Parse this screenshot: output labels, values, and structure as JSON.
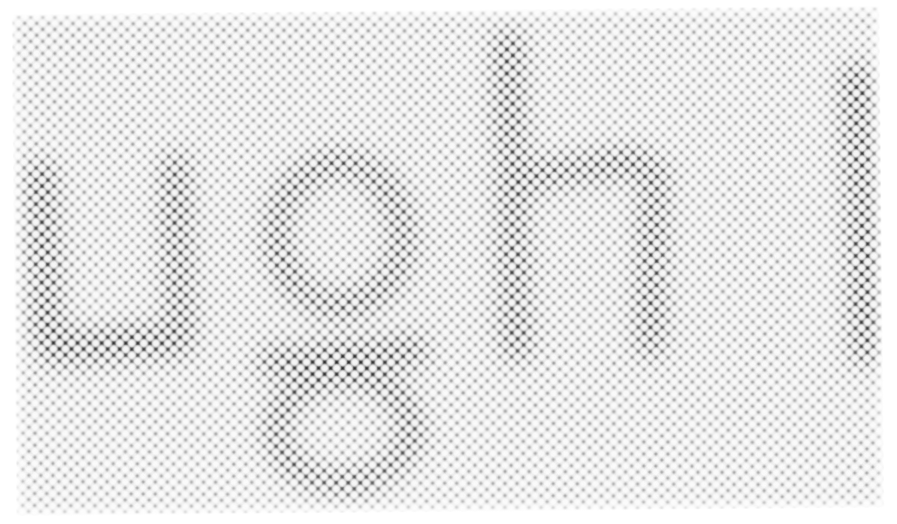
{
  "image": {
    "kind": "macro-photograph",
    "subject": "halftone printed text magnified",
    "printed_word": "ight",
    "word_note": "partial word, letters cropped at left and right edges",
    "letters": [
      "i",
      "g",
      "h",
      "t"
    ],
    "screen_pattern": "hexagonal staggered dot screen",
    "dot_pitch_px": 11.6,
    "screen_angle_deg": 0.8,
    "patch_rotation_deg": -0.55,
    "colors": {
      "page_background": "#ffffff",
      "paper_midtone": "#cfcfcf",
      "dot_highlight": "#ffffff",
      "ink_dark": "#151515",
      "screen_web": "#282828"
    },
    "patch": {
      "left": 14,
      "top": 10,
      "width": 868,
      "height": 502
    },
    "strokes": [
      {
        "name": "i-stem-left",
        "type": "bar",
        "x": 16,
        "y": 148,
        "w": 30,
        "h": 190,
        "rot": -1.5
      },
      {
        "name": "i-bowl-bottom",
        "type": "bar",
        "x": 26,
        "y": 314,
        "w": 150,
        "h": 34,
        "rot": -4
      },
      {
        "name": "i-stem-right",
        "type": "bar",
        "x": 150,
        "y": 142,
        "w": 28,
        "h": 200,
        "rot": -1
      },
      {
        "name": "g-bowl",
        "type": "ring",
        "x": 250,
        "y": 140,
        "w": 152,
        "h": 168,
        "bw": 26,
        "rot": -2
      },
      {
        "name": "g-link",
        "type": "bar",
        "x": 244,
        "y": 330,
        "w": 170,
        "h": 30,
        "rot": -4
      },
      {
        "name": "g-descender",
        "type": "ring",
        "x": 248,
        "y": 352,
        "w": 160,
        "h": 132,
        "bw": 25,
        "rot": -2
      },
      {
        "name": "h-ascender",
        "type": "bar",
        "x": 484,
        "y": 22,
        "w": 30,
        "h": 330,
        "rot": -1
      },
      {
        "name": "h-shoulder",
        "type": "bar",
        "x": 506,
        "y": 146,
        "w": 130,
        "h": 28,
        "rot": -7
      },
      {
        "name": "h-right-leg",
        "type": "bar",
        "x": 624,
        "y": 150,
        "w": 28,
        "h": 200,
        "rot": 1.5
      },
      {
        "name": "t-stem",
        "type": "bar",
        "x": 832,
        "y": 58,
        "w": 32,
        "h": 300,
        "rot": -1.5
      }
    ]
  }
}
